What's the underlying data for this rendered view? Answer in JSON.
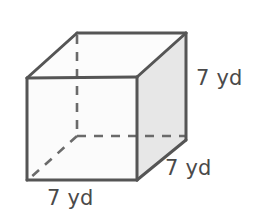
{
  "figure": {
    "name": "cube-solid-figure",
    "shape": "cube",
    "unit": "yd",
    "edge_length": 7,
    "labels": {
      "height": "7 yd",
      "depth": "7 yd",
      "width": "7 yd"
    },
    "colors": {
      "outline": "#555555",
      "hidden_edge": "#6a6a6a",
      "front_face": "#fbfbfb",
      "right_face": "#e7e7e7",
      "top_face": "#fcfcfc",
      "label_text": "#4a4a4a",
      "background": "#ffffff"
    },
    "geometry": {
      "front_top_left": [
        27,
        78
      ],
      "front_top_right": [
        137,
        77
      ],
      "front_bottom_right": [
        137,
        180
      ],
      "front_bottom_left": [
        27,
        180
      ],
      "back_top_left": [
        77,
        33
      ],
      "back_top_right": [
        186,
        33
      ],
      "back_bottom_right": [
        186,
        140
      ],
      "back_bottom_left": [
        77,
        136
      ]
    }
  }
}
